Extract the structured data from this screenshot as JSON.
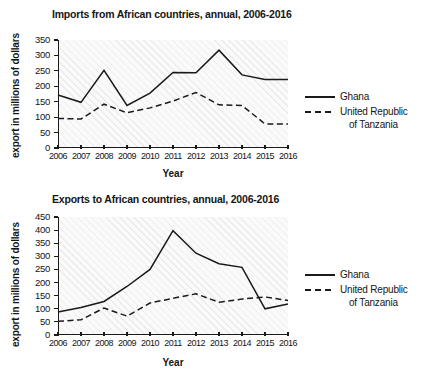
{
  "chart_data": [
    {
      "type": "line",
      "id": "imports",
      "title": "Imports from African countries, annual, 2006-2016",
      "xlabel": "Year",
      "ylabel": "export in millions of dollars",
      "categories": [
        "2006",
        "2007",
        "2008",
        "2009",
        "2010",
        "2011",
        "2012",
        "2013",
        "2014",
        "2015",
        "2016"
      ],
      "xticklabels": [
        "2006",
        "2007",
        "2008",
        "2009",
        "2010",
        "2011",
        "2012",
        "2013",
        "2014",
        "2015",
        "2016"
      ],
      "yticklabels": [
        "0",
        "50",
        "100",
        "150",
        "200",
        "250",
        "300",
        "350"
      ],
      "yticks": [
        0,
        50,
        100,
        150,
        200,
        250,
        300,
        350
      ],
      "ylim": [
        0,
        350
      ],
      "grid": false,
      "legend_position": "right",
      "series": [
        {
          "name": "Ghana",
          "style": "solid",
          "color": "#1a1a1a",
          "values": [
            172,
            148,
            252,
            138,
            178,
            245,
            244,
            317,
            237,
            222,
            222
          ]
        },
        {
          "name": "United Republic of Tanzania",
          "style": "dashed",
          "color": "#1a1a1a",
          "values": [
            96,
            94,
            142,
            114,
            130,
            152,
            180,
            140,
            138,
            78,
            78
          ]
        }
      ]
    },
    {
      "type": "line",
      "id": "exports",
      "title": "Exports to African countries, annual, 2006-2016",
      "xlabel": "Year",
      "ylabel": "export in millions of dollars",
      "categories": [
        "2006",
        "2007",
        "2008",
        "2009",
        "2010",
        "2011",
        "2012",
        "2013",
        "2014",
        "2015",
        "2016"
      ],
      "xticklabels": [
        "2006",
        "2007",
        "2008",
        "2009",
        "2010",
        "2011",
        "2012",
        "2013",
        "2014",
        "2015",
        "2016"
      ],
      "yticklabels": [
        "0",
        "50",
        "100",
        "150",
        "200",
        "250",
        "300",
        "350",
        "400",
        "450"
      ],
      "yticks": [
        0,
        50,
        100,
        150,
        200,
        250,
        300,
        350,
        400,
        450
      ],
      "ylim": [
        0,
        450
      ],
      "grid": false,
      "legend_position": "right",
      "series": [
        {
          "name": "Ghana",
          "style": "solid",
          "color": "#1a1a1a",
          "values": [
            88,
            105,
            128,
            185,
            250,
            398,
            312,
            272,
            258,
            100,
            118
          ]
        },
        {
          "name": "United Republic of Tanzania",
          "style": "dashed",
          "color": "#1a1a1a",
          "values": [
            52,
            58,
            103,
            72,
            122,
            140,
            157,
            125,
            137,
            145,
            132
          ]
        }
      ]
    }
  ],
  "legend": {
    "ghana_label": "Ghana",
    "tanzania_label_line1": "United Republic",
    "tanzania_label_line2": "of Tanzania"
  }
}
